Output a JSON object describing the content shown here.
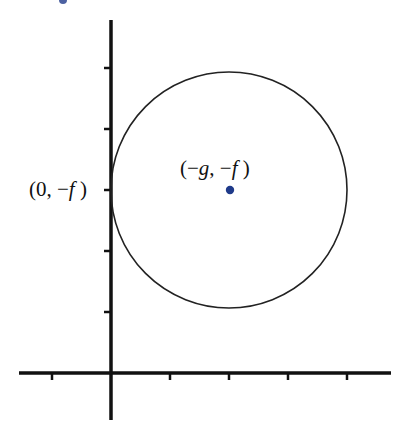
{
  "diagram": {
    "title": "",
    "type": "circle-on-axes",
    "axes": {
      "origin_px": [
        111,
        373
      ],
      "x_axis": {
        "from_px": 19,
        "to_px": 391,
        "tick_positions_px": [
          52,
          170,
          229,
          288,
          347
        ]
      },
      "y_axis": {
        "from_px": 20,
        "to_px": 420,
        "tick_positions_px": [
          68,
          129,
          190,
          251,
          312
        ]
      },
      "line_color": "#111111"
    },
    "circle": {
      "center_px": [
        229,
        190
      ],
      "radius_px": 118,
      "stroke_color": "#222222",
      "tangent_to": "y-axis"
    },
    "center_point": {
      "color": "#1f3a8a",
      "label_parts": [
        "(−",
        "g",
        ", −",
        "f",
        " )"
      ],
      "label": "(−g, −f )"
    },
    "tangent_point": {
      "label_parts": [
        "(0, −",
        "f",
        " )"
      ],
      "label": "(0, −f )"
    },
    "artifact_dot": {
      "color": "#1f3a8a",
      "position_px": [
        63,
        0
      ]
    }
  }
}
